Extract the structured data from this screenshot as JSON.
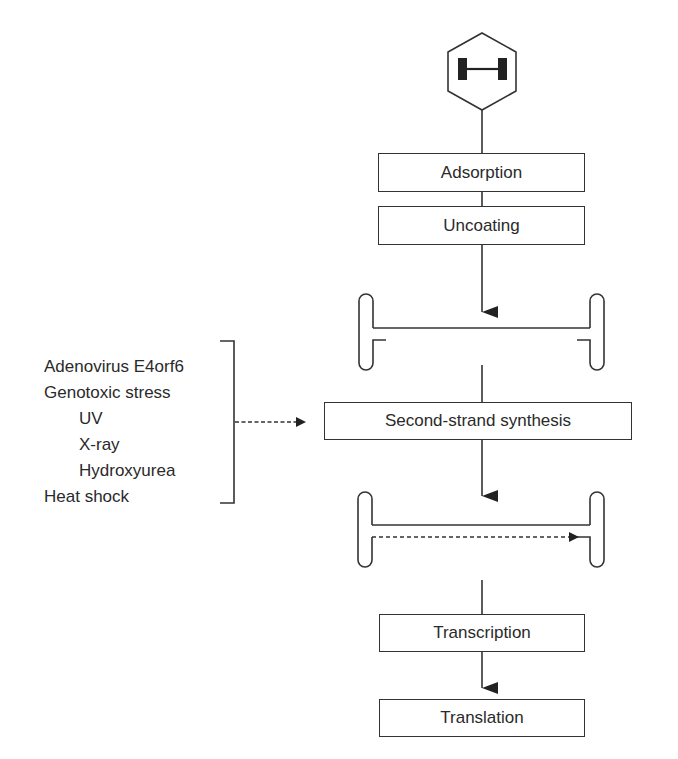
{
  "diagram": {
    "virus_icon": {
      "shape": "hexagon",
      "glyph": "H-shaped genome (ITR ends)"
    },
    "steps": [
      {
        "id": "adsorption",
        "label": "Adsorption"
      },
      {
        "id": "uncoating",
        "label": "Uncoating"
      },
      {
        "id": "second-strand-synthesis",
        "label": "Second-strand synthesis"
      },
      {
        "id": "transcription",
        "label": "Transcription"
      },
      {
        "id": "translation",
        "label": "Translation"
      }
    ],
    "dna_intermediates": [
      {
        "id": "single-stranded-genome",
        "description": "Single-stranded DNA with hairpin termini"
      },
      {
        "id": "double-stranded-genome",
        "description": "Second strand being synthesized (dashed arrow)"
      }
    ],
    "enhancing_factors": {
      "items": [
        {
          "label": "Adenovirus E4orf6",
          "indent": 0
        },
        {
          "label": "Genotoxic stress",
          "indent": 0
        },
        {
          "label": "UV",
          "indent": 1
        },
        {
          "label": "X-ray",
          "indent": 1
        },
        {
          "label": "Hydroxyurea",
          "indent": 1
        },
        {
          "label": "Heat shock",
          "indent": 0
        }
      ],
      "target": "second-strand-synthesis",
      "arrow_style": "dashed"
    },
    "colors": {
      "stroke": "#333333",
      "text": "#2a2a2a",
      "background": "#ffffff"
    }
  }
}
